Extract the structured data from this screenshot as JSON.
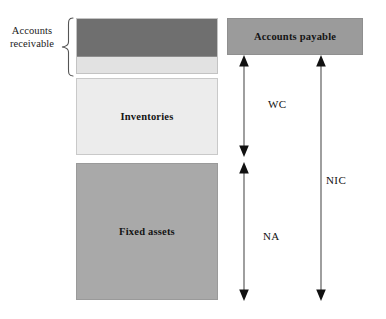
{
  "diagram": {
    "background_color": "#ffffff"
  },
  "left_annotation": {
    "label_line1": "Accounts",
    "label_line2": "receivable",
    "brace": "right-curly-brace"
  },
  "asset_side": {
    "boxes": [
      {
        "id": "accounts-receivable",
        "label": "",
        "fill_dark": "#6f6f6f",
        "fill_light": "#e2e2e2"
      },
      {
        "id": "inventories",
        "label": "Inventories",
        "fill": "#ececec"
      },
      {
        "id": "fixed-assets",
        "label": "Fixed assets",
        "fill": "#a9a9a9"
      }
    ]
  },
  "liability_side": {
    "boxes": [
      {
        "id": "accounts-payable",
        "label": "Accounts payable",
        "fill": "#9b9b9b"
      }
    ]
  },
  "measures": [
    {
      "id": "wc",
      "label": "WC",
      "description": "Working capital span"
    },
    {
      "id": "na",
      "label": "NA",
      "description": "Net fixed assets span"
    },
    {
      "id": "nic",
      "label": "NIC",
      "description": "Net invested capital span"
    }
  ],
  "colors": {
    "stroke": "#6b6b6b",
    "arrow_head": "#111111",
    "text": "#141414",
    "box_border": "#b9b9b9"
  }
}
